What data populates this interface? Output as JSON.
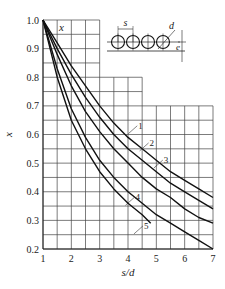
{
  "chart_data": {
    "type": "line",
    "title": "",
    "xlabel": "s/d",
    "ylabel": "x",
    "xlim": [
      1,
      7
    ],
    "ylim": [
      0.2,
      1.0
    ],
    "xticks": [
      "1",
      "2",
      "3",
      "4",
      "5",
      "6",
      "7"
    ],
    "yticks": [
      "1.0",
      "0.9",
      "0.8",
      "0.7",
      "0.6",
      "0.5",
      "0.4",
      "0.3",
      "0.2"
    ],
    "grid": true,
    "inner_label": "x",
    "legend_position": "inline curve labels",
    "inset_labels": {
      "s": "s",
      "d": "d",
      "e": "e"
    },
    "series": [
      {
        "name": "1",
        "x": [
          1,
          1.5,
          2,
          2.5,
          3,
          3.5,
          4,
          4.5,
          5,
          5.5,
          6,
          6.5,
          7
        ],
        "y": [
          1.0,
          0.92,
          0.84,
          0.77,
          0.7,
          0.64,
          0.59,
          0.55,
          0.51,
          0.47,
          0.44,
          0.41,
          0.38
        ]
      },
      {
        "name": "2",
        "x": [
          1,
          1.5,
          2,
          2.5,
          3,
          3.5,
          4,
          4.5,
          5,
          5.5,
          6,
          6.5,
          7
        ],
        "y": [
          1.0,
          0.9,
          0.81,
          0.73,
          0.66,
          0.6,
          0.55,
          0.51,
          0.47,
          0.43,
          0.4,
          0.37,
          0.34
        ]
      },
      {
        "name": "3",
        "x": [
          1,
          1.5,
          2,
          2.5,
          3,
          3.5,
          4,
          4.5,
          5,
          5.5,
          6,
          6.5,
          7
        ],
        "y": [
          1.0,
          0.88,
          0.77,
          0.68,
          0.61,
          0.55,
          0.5,
          0.45,
          0.41,
          0.38,
          0.34,
          0.31,
          0.29
        ]
      },
      {
        "name": "4",
        "x": [
          1,
          1.5,
          2,
          2.5,
          3,
          3.5,
          4,
          4.5,
          5,
          5.5,
          6,
          6.5,
          7
        ],
        "y": [
          1.0,
          0.83,
          0.69,
          0.59,
          0.51,
          0.45,
          0.4,
          0.36,
          0.32,
          0.29,
          0.26,
          0.23,
          0.2
        ]
      },
      {
        "name": "5",
        "x": [
          1,
          1.5,
          2,
          2.5,
          3,
          3.5,
          4,
          4.5,
          4.8
        ],
        "y": [
          1.0,
          0.8,
          0.65,
          0.55,
          0.47,
          0.41,
          0.36,
          0.32,
          0.29
        ]
      }
    ]
  }
}
